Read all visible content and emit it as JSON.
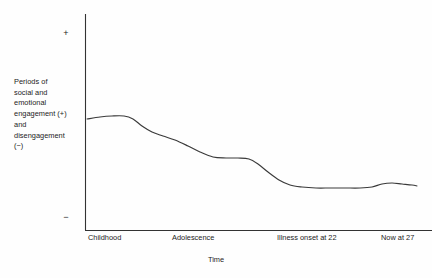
{
  "chart_data": {
    "type": "line",
    "title": "",
    "subtitle": "",
    "xlabel": "Time",
    "ylabel": "Periods of social and emotional engagement (+) and disengagement (−)",
    "ylabel_lines": [
      "Periods of",
      "social and",
      "emotional",
      "engagement (+)",
      "and",
      "disengagement",
      "(−)"
    ],
    "y_axis_markers": {
      "positive": "+",
      "negative": "−"
    },
    "x_tick_labels": [
      "Childhood",
      "Adolescence",
      "Illness onset at 22",
      "Now at 27"
    ],
    "x_tick_positions_px": [
      88,
      172,
      277,
      381
    ],
    "grid": false,
    "legend": null,
    "axis_color": "#333333",
    "line_color": "#3a3a3a",
    "background_color": "#fefefe",
    "plot_area_px": {
      "left": 85,
      "right": 432,
      "top": 14,
      "bottom": 230
    },
    "ylim_labels": [
      "−",
      "+"
    ],
    "series": [
      {
        "name": "Social and emotional engagement",
        "points_px": [
          [
            87,
            119
          ],
          [
            100,
            117
          ],
          [
            112,
            116
          ],
          [
            124,
            116
          ],
          [
            133,
            119
          ],
          [
            142,
            126
          ],
          [
            152,
            132
          ],
          [
            163,
            136
          ],
          [
            175,
            140
          ],
          [
            188,
            146
          ],
          [
            200,
            152
          ],
          [
            213,
            157
          ],
          [
            226,
            158
          ],
          [
            238,
            158
          ],
          [
            249,
            159
          ],
          [
            258,
            164
          ],
          [
            268,
            172
          ],
          [
            279,
            180
          ],
          [
            290,
            185
          ],
          [
            302,
            187
          ],
          [
            316,
            188
          ],
          [
            330,
            188
          ],
          [
            345,
            188
          ],
          [
            360,
            188
          ],
          [
            372,
            187
          ],
          [
            382,
            184
          ],
          [
            392,
            183
          ],
          [
            402,
            184
          ],
          [
            412,
            185
          ],
          [
            417,
            186
          ]
        ],
        "values_described": [
          {
            "x_label": "Childhood",
            "engagement": "high / positive plateau"
          },
          {
            "x_label": "Adolescence",
            "engagement": "steady decline"
          },
          {
            "x_label": "Illness onset at 22",
            "engagement": "sharp drop to low plateau"
          },
          {
            "x_label": "Now at 27",
            "engagement": "low, slight uptick"
          }
        ]
      }
    ]
  },
  "x_axis": {
    "title": "Time",
    "ticks": [
      {
        "label": "Childhood",
        "left_px": 88
      },
      {
        "label": "Adolescence",
        "left_px": 172
      },
      {
        "label": "Illness onset at 22",
        "left_px": 277
      },
      {
        "label": "Now at 27",
        "left_px": 381
      }
    ]
  },
  "y_axis": {
    "caption_lines": [
      "Periods of",
      "social and",
      "emotional",
      "engagement (+)",
      "and",
      "disengagement",
      "(−)"
    ],
    "positive_marker": "+",
    "negative_marker": "−"
  }
}
